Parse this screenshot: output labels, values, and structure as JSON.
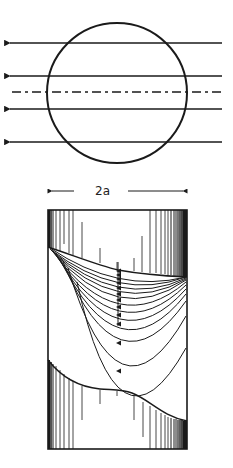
{
  "figure": {
    "top": {
      "description": "circle cross-section with parallel flow lines",
      "circle": {
        "cx": 117,
        "cy": 93,
        "r": 70
      },
      "arrow_lines_y": [
        43,
        76,
        109,
        142
      ],
      "centerline_y": 92,
      "line_x_start": 8,
      "line_x_end": 222,
      "arrow_direction": "left"
    },
    "dimension": {
      "label": "2a",
      "y": 191,
      "x_start": 48,
      "x_end": 187
    },
    "bottom": {
      "description": "cylinder side view with nested U-shaped streamlines",
      "rect": {
        "x": 48,
        "y": 210,
        "width": 139,
        "height": 239
      },
      "apex_x": 118,
      "u_curve_apex_y": [
        271,
        275,
        279,
        283,
        288,
        294,
        300,
        307,
        315,
        324,
        343,
        371
      ]
    },
    "colors": {
      "ink": "#1a1a1a",
      "background": "#ffffff"
    }
  }
}
